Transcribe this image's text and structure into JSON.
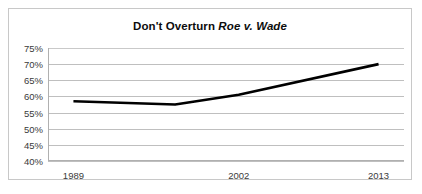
{
  "chart_data": {
    "type": "line",
    "title": "Don't Overturn Roe v. Wade",
    "title_prefix": "Don't Overturn ",
    "title_case_name": "Roe v. Wade",
    "xlabel": "",
    "ylabel": "",
    "ylim": [
      40,
      75
    ],
    "y_tick_labels": [
      "75%",
      "70%",
      "65%",
      "60%",
      "55%",
      "50%",
      "45%",
      "40%"
    ],
    "y_ticks": [
      75,
      70,
      65,
      60,
      55,
      50,
      45,
      40
    ],
    "x_tick_labels": [
      "1989",
      "2002",
      "2013"
    ],
    "x_ticks": [
      1989,
      2002,
      2013
    ],
    "xlim": [
      1987,
      2015
    ],
    "grid": true,
    "legend": false,
    "series": [
      {
        "name": "Don't Overturn Roe v. Wade",
        "color": "#000000",
        "x": [
          1989,
          1997,
          2002,
          2013
        ],
        "values": [
          58.5,
          57.5,
          60.5,
          70.0
        ]
      }
    ]
  },
  "axis": {
    "y_labels": [
      {
        "label": "75%",
        "value": 75
      },
      {
        "label": "70%",
        "value": 70
      },
      {
        "label": "65%",
        "value": 65
      },
      {
        "label": "60%",
        "value": 60
      },
      {
        "label": "55%",
        "value": 55
      },
      {
        "label": "50%",
        "value": 50
      },
      {
        "label": "45%",
        "value": 45
      },
      {
        "label": "40%",
        "value": 40
      }
    ],
    "x_labels": [
      {
        "label": "1989",
        "value": 1989
      },
      {
        "label": "2002",
        "value": 2002
      },
      {
        "label": "2013",
        "value": 2013
      }
    ]
  },
  "style": {
    "line_color": "#000000",
    "gridline_color": "#bfbfbf",
    "axis_color": "#b0b0b0",
    "border_color": "#c8c8c8",
    "background": "#ffffff",
    "text_color": "#3a3a3a",
    "title_color": "#0d0d0d"
  }
}
